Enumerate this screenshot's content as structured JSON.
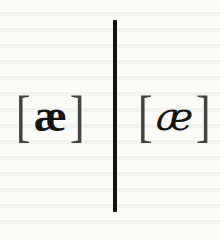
{
  "figure": {
    "left": {
      "open_bracket": "[",
      "symbol": "æ",
      "close_bracket": "]",
      "style": "upright-serif"
    },
    "right": {
      "open_bracket": "[",
      "symbol": "æ",
      "close_bracket": "]",
      "style": "rounded-script"
    },
    "divider_color": "#111111",
    "background_color": "#fbfbf9"
  }
}
